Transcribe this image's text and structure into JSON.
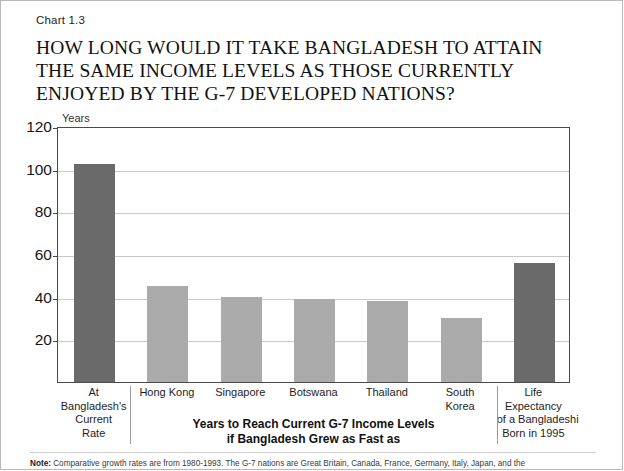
{
  "header": {
    "chart_number": "Chart 1.3",
    "title_lines": [
      "HOW LONG WOULD IT TAKE BANGLADESH TO ATTAIN",
      "THE SAME INCOME LEVELS AS THOSE CURRENTLY",
      "ENJOYED BY THE G-7 DEVELOPED NATIONS?"
    ]
  },
  "footnote": {
    "label": "Note:",
    "text": "Comparative growth rates are from 1980-1993. The G-7 nations are Great Britain, Canada, France, Germany, Italy, Japan, and the"
  },
  "groups": {
    "left_caption_lines": [
      "At",
      "Bangladesh's",
      "Current",
      "Rate"
    ],
    "middle_caption_lines": [
      "Years to Reach Current G-7 Income Levels",
      "if Bangladesh Grew as Fast as"
    ],
    "right_caption_lines": [
      "Life",
      "Expectancy",
      "of a Bangladeshi",
      "Born in 1995"
    ]
  },
  "chart_data": {
    "type": "bar",
    "title": "HOW LONG WOULD IT TAKE BANGLADESH TO ATTAIN THE SAME INCOME LEVELS AS THOSE CURRENTLY ENJOYED BY THE G-7 DEVELOPED NATIONS?",
    "subtitle": "Chart 1.3",
    "xlabel": "",
    "ylabel": "Years",
    "ylim": [
      0,
      120
    ],
    "yticks": [
      20,
      40,
      60,
      80,
      100,
      120
    ],
    "grid": true,
    "legend": "none",
    "categories": [
      "At Bangladesh's Current Rate",
      "Hong Kong",
      "Singapore",
      "Botswana",
      "Thailand",
      "South Korea",
      "Life Expectancy of a Bangladeshi Born in 1995"
    ],
    "category_label_lines": [
      [
        "At",
        "Bangladesh's",
        "Current",
        "Rate"
      ],
      [
        "Hong Kong"
      ],
      [
        "Singapore"
      ],
      [
        "Botswana"
      ],
      [
        "Thailand"
      ],
      [
        "South",
        "Korea"
      ],
      [
        "Life",
        "Expectancy",
        "of a Bangladeshi",
        "Born in 1995"
      ]
    ],
    "values": [
      102,
      45,
      40,
      39,
      38,
      30,
      56
    ],
    "bar_colors": [
      "#6a6a6a",
      "#ababab",
      "#ababab",
      "#ababab",
      "#ababab",
      "#ababab",
      "#6a6a6a"
    ],
    "colors": {
      "dark_bar": "#6a6a6a",
      "light_bar": "#ababab",
      "grid": "#c9c9c9",
      "axis": "#4a4a4a"
    }
  }
}
